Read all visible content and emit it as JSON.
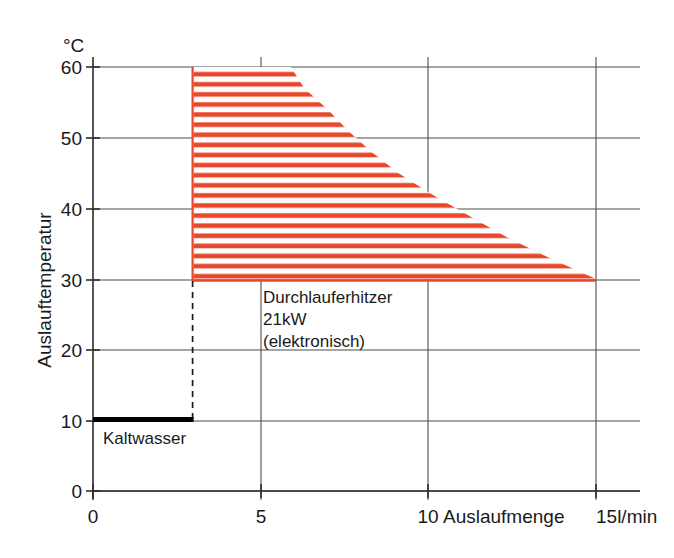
{
  "chart_data": {
    "type": "area",
    "title": "",
    "xlabel": "Auslaufmenge",
    "xunit": "15l/min",
    "ylabel": "Auslauftemperatur",
    "yunit": "°C",
    "xlim": [
      0,
      15
    ],
    "ylim": [
      0,
      60
    ],
    "x_ticks": [
      {
        "value": 0,
        "label": "0"
      },
      {
        "value": 5,
        "label": "5"
      },
      {
        "value": 10,
        "label": "10"
      },
      {
        "value": 15,
        "label": "15"
      }
    ],
    "x_tick_labels": [
      "0",
      "5",
      "10",
      "15"
    ],
    "y_ticks": [
      0,
      10,
      20,
      30,
      40,
      50,
      60
    ],
    "y_tick_labels": [
      "0",
      "10",
      "20",
      "30",
      "40",
      "50",
      "60"
    ],
    "grid": true,
    "legend_position": "none",
    "series": [
      {
        "name": "Durchlauferhitzer 21kW (elektronisch)",
        "kind": "hatched-region",
        "color": "#e8472a",
        "description": "Operating envelope: outlet temperature vs flow rate, bounded left at 3 l/min, bottom at 30 °C, right at 15 l/min, top at 60 °C.",
        "min_flow": 3,
        "max_flow": 15,
        "min_temp": 30,
        "max_temp": 60,
        "boundary": [
          {
            "flow": 3,
            "temp": 60
          },
          {
            "flow": 5.9,
            "temp": 60
          },
          {
            "flow": 6.3,
            "temp": 57
          },
          {
            "flow": 7.0,
            "temp": 54
          },
          {
            "flow": 7.6,
            "temp": 51
          },
          {
            "flow": 8.3,
            "temp": 48
          },
          {
            "flow": 9.1,
            "temp": 45
          },
          {
            "flow": 10.1,
            "temp": 42
          },
          {
            "flow": 11.2,
            "temp": 39
          },
          {
            "flow": 12.3,
            "temp": 36
          },
          {
            "flow": 13.6,
            "temp": 33
          },
          {
            "flow": 15.0,
            "temp": 30
          },
          {
            "flow": 3,
            "temp": 30
          }
        ]
      },
      {
        "name": "Kaltwasser",
        "kind": "line",
        "color": "#000000",
        "temp": 10,
        "flow_from": 0,
        "flow_to": 3
      }
    ],
    "annotations": [
      {
        "name": "heater-annotation",
        "lines": [
          "Durchlauferhitzer",
          "21kW",
          "(elektronisch)"
        ],
        "at_flow": 5.0,
        "at_temp": 28
      },
      {
        "name": "cold-water-annotation",
        "lines": [
          "Kaltwasser"
        ],
        "at_flow": 0.3,
        "at_temp": 8
      }
    ],
    "guide_lines": [
      {
        "name": "min-flow-dashed-guide",
        "style": "dashed",
        "flow": 3,
        "temp_from": 10,
        "temp_to": 30
      }
    ]
  },
  "labels": {
    "y_axis_title": "Auslauftemperatur",
    "y_axis_unit": "°C",
    "x_axis_title": "Auslaufmenge",
    "x_axis_unit": "15l/min",
    "annotation_line1": "Durchlauferhitzer",
    "annotation_line2": "21kW",
    "annotation_line3": "(elektronisch)",
    "cold_water": "Kaltwasser",
    "x0": "0",
    "x5": "5",
    "x10": "10",
    "y0": "0",
    "y10": "10",
    "y20": "20",
    "y30": "30",
    "y40": "40",
    "y50": "50",
    "y60": "60"
  },
  "colors": {
    "hatch_red": "#e8472a",
    "axis_black": "#2b2b2b",
    "grid_gray": "#4d4d4d"
  }
}
